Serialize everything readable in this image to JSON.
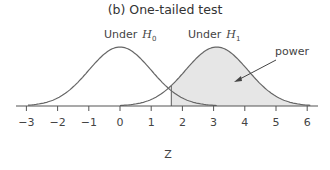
{
  "title": "(b) One-tailed test",
  "chart_data": {
    "type": "line",
    "title": "(b) One-tailed test",
    "xlabel": "Z",
    "ylabel": "",
    "xlim": [
      -3,
      6
    ],
    "x_ticks": [
      -3,
      -2,
      -1,
      0,
      1,
      2,
      3,
      4,
      5,
      6
    ],
    "series": [
      {
        "name": "Under H0",
        "distribution": "normal",
        "mean": 0,
        "sd": 1
      },
      {
        "name": "Under H1",
        "distribution": "normal",
        "mean": 3.1,
        "sd": 1
      }
    ],
    "critical_value": 1.645,
    "shaded_region": {
      "series": "Under H1",
      "from": 1.645,
      "to": 6,
      "label": "power"
    },
    "annotations": [
      "Under H0",
      "Under H1",
      "power"
    ],
    "grid": false,
    "legend": "none"
  },
  "labels": {
    "h0_prefix": "Under",
    "h0_symbol": "H",
    "h0_sub": "0",
    "h1_prefix": "Under",
    "h1_symbol": "H",
    "h1_sub": "1",
    "power": "power",
    "xlabel": "Z",
    "ticks": [
      "−3",
      "−2",
      "−1",
      "0",
      "1",
      "2",
      "3",
      "4",
      "5",
      "6"
    ]
  },
  "colors": {
    "curve": "#666666",
    "shade": "#e6e6e6",
    "axis": "#555555",
    "text": "#444444"
  }
}
